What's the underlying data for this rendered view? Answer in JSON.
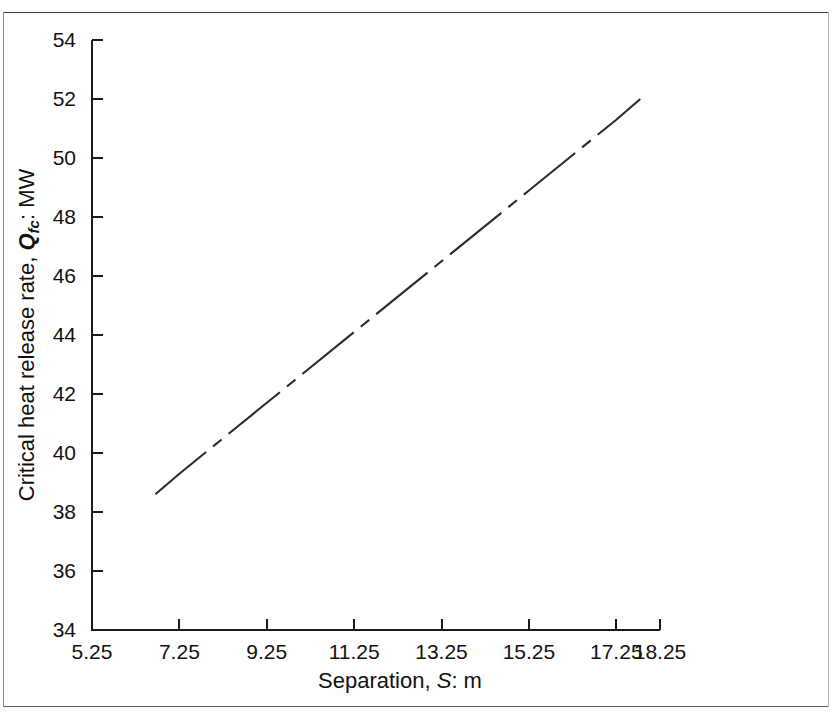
{
  "figure": {
    "background": "#ffffff",
    "line_color": "#2b2b2b",
    "axis_color": "#1a1a1a",
    "border_color": "#3a3a3a"
  },
  "axis_titles": {
    "x_prefix": "Separation, ",
    "x_symbol": "S",
    "x_suffix": ": m",
    "y_prefix": "Critical heat release rate, ",
    "y_symbol": "Q",
    "y_symbol_subscript": "fc",
    "y_suffix": ": MW"
  },
  "x_ticks": [
    "5.25",
    "7.25",
    "9.25",
    "11.25",
    "13.25",
    "15.25",
    "17.25",
    "18.25"
  ],
  "y_ticks": [
    "34",
    "36",
    "38",
    "40",
    "42",
    "44",
    "46",
    "48",
    "50",
    "52",
    "54"
  ],
  "chart_data": {
    "type": "line",
    "title": "",
    "subtitle": "",
    "xlabel": "Separation, S: m",
    "ylabel": "Critical heat release rate, Qfc: MW",
    "xlim": [
      5.25,
      18.25
    ],
    "ylim": [
      34,
      54
    ],
    "xticks": [
      5.25,
      7.25,
      9.25,
      11.25,
      13.25,
      15.25,
      17.25,
      18.25
    ],
    "yticks": [
      34,
      36,
      38,
      40,
      42,
      44,
      46,
      48,
      50,
      52,
      54
    ],
    "grid": false,
    "legend": null,
    "series": [
      {
        "name": "Critical heat release rate",
        "linestyle": "dash-dot",
        "color": "#2b2b2b",
        "x": [
          6.7,
          7.25,
          9.25,
          11.25,
          13.25,
          15.25,
          17.25,
          17.8
        ],
        "y": [
          38.6,
          39.3,
          41.7,
          44.1,
          46.5,
          48.9,
          51.3,
          52.0
        ]
      }
    ],
    "annotations": []
  }
}
